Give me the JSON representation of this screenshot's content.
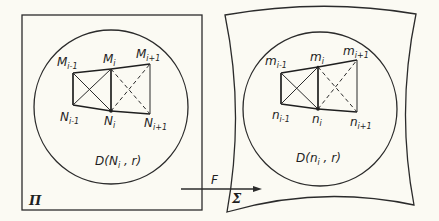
{
  "diagram": {
    "left_panel": {
      "region_label": "Π",
      "disk_label": {
        "main": "D(N",
        "sub": "i",
        "tail": " , r)"
      },
      "top_points": [
        {
          "name": "M",
          "sub": "i-1"
        },
        {
          "name": "M",
          "sub": "i"
        },
        {
          "name": "M",
          "sub": "i+1"
        }
      ],
      "bottom_points": [
        {
          "name": "N",
          "sub": "i-1"
        },
        {
          "name": "N",
          "sub": "i"
        },
        {
          "name": "N",
          "sub": "i+1"
        }
      ]
    },
    "right_panel": {
      "region_label": "Σ",
      "disk_label": {
        "main": "D(n",
        "sub": "i",
        "tail": " , r)"
      },
      "top_points": [
        {
          "name": "m",
          "sub": "i-1"
        },
        {
          "name": "m",
          "sub": "i"
        },
        {
          "name": "m",
          "sub": "i+1"
        }
      ],
      "bottom_points": [
        {
          "name": "n",
          "sub": "i-1"
        },
        {
          "name": "n",
          "sub": "i"
        },
        {
          "name": "n",
          "sub": "i+1"
        }
      ]
    },
    "mapping": {
      "label": "F"
    }
  }
}
